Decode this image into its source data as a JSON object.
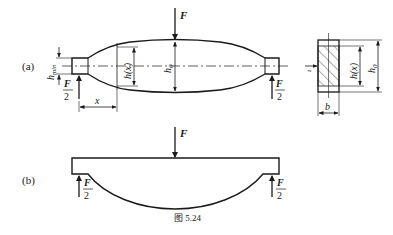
{
  "figure": {
    "caption": "图 5.24",
    "panels": [
      {
        "id": "a",
        "label": "(a)",
        "load_top": "F",
        "support_num": "F",
        "support_den": "2",
        "dim_hmin": "h",
        "dim_hmin_sub": "min",
        "dim_hx": "h(x)",
        "dim_h0": "h",
        "dim_h0_sub": "0",
        "dim_x": "x",
        "section": {
          "dim_hx": "h(x)",
          "dim_h0": "h",
          "dim_h0_sub": "0",
          "dim_b": "b",
          "axis_label": "z"
        }
      },
      {
        "id": "b",
        "label": "(b)",
        "load_top": "F",
        "support_num": "F",
        "support_den": "2"
      }
    ]
  },
  "colors": {
    "stroke": "#1a1a1a",
    "background": "#ffffff"
  }
}
